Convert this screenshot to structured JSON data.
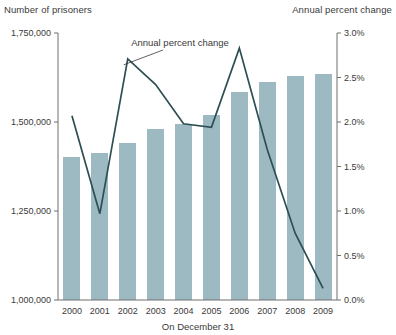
{
  "chart_data": {
    "type": "bar",
    "title": "",
    "xlabel": "On December 31",
    "categories": [
      "2000",
      "2001",
      "2002",
      "2003",
      "2004",
      "2005",
      "2006",
      "2007",
      "2008",
      "2009"
    ],
    "grid": false,
    "legend_position": "inline-annotation",
    "annotations": [
      {
        "text": "Annual percent change",
        "target_category": "2002",
        "series": "Annual percent change"
      }
    ],
    "axes": {
      "left": {
        "label": "Number of prisoners",
        "ylim": [
          1000000,
          1750000
        ],
        "ticks": [
          1000000,
          1250000,
          1500000,
          1750000
        ],
        "tick_labels": [
          "1,000,000",
          "1,250,000",
          "1,500,000",
          "1,750,000"
        ]
      },
      "right": {
        "label": "Annual percent change",
        "ylim": [
          0.0,
          3.0
        ],
        "ticks": [
          0.0,
          0.5,
          1.0,
          1.5,
          2.0,
          2.5,
          3.0
        ],
        "tick_labels": [
          "0.0%",
          "0.5%",
          "1.0%",
          "1.5%",
          "2.0%",
          "2.5%",
          "3.0%"
        ]
      }
    },
    "series": [
      {
        "name": "Number of prisoners",
        "type": "bar",
        "axis": "left",
        "color": "#9dbac3",
        "values": [
          1402000,
          1413000,
          1441000,
          1480000,
          1494000,
          1520000,
          1584000,
          1612000,
          1629000,
          1635000
        ]
      },
      {
        "name": "Annual percent change",
        "type": "line",
        "axis": "right",
        "color": "#2d4f54",
        "values": [
          2.07,
          0.97,
          2.71,
          2.42,
          1.98,
          1.94,
          2.83,
          1.69,
          0.75,
          0.13
        ]
      }
    ]
  },
  "colors": {
    "bar": "#9dbac3",
    "line": "#2d4f54",
    "axis": "#6f6f6f",
    "text": "#3a3a3a",
    "background": "#ffffff"
  }
}
